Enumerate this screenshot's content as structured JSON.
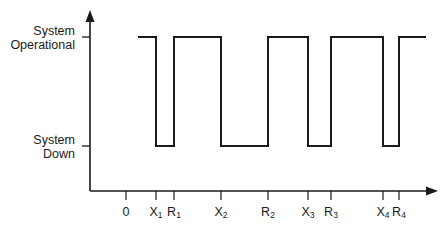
{
  "diagram": {
    "title": "",
    "y_levels": [
      {
        "id": "up",
        "label_lines": [
          "System",
          "Operational"
        ]
      },
      {
        "id": "down",
        "label_lines": [
          "System",
          "Down"
        ]
      }
    ],
    "x_ticks": [
      {
        "main": "0",
        "sub": ""
      },
      {
        "main": "X",
        "sub": "1"
      },
      {
        "main": "R",
        "sub": "1"
      },
      {
        "main": "X",
        "sub": "2"
      },
      {
        "main": "R",
        "sub": "2"
      },
      {
        "main": "X",
        "sub": "3"
      },
      {
        "main": "R",
        "sub": "3"
      },
      {
        "main": "X",
        "sub": "4"
      },
      {
        "main": "R",
        "sub": "4"
      }
    ],
    "waveform": [
      {
        "state": "up",
        "from": "start",
        "to": "X1"
      },
      {
        "state": "down",
        "from": "X1",
        "to": "R1"
      },
      {
        "state": "up",
        "from": "R1",
        "to": "X2"
      },
      {
        "state": "down",
        "from": "X2",
        "to": "R2"
      },
      {
        "state": "up",
        "from": "R2",
        "to": "X3"
      },
      {
        "state": "down",
        "from": "X3",
        "to": "R3"
      },
      {
        "state": "up",
        "from": "R3",
        "to": "X4"
      },
      {
        "state": "down",
        "from": "X4",
        "to": "R4"
      },
      {
        "state": "up",
        "from": "R4",
        "to": "end"
      }
    ],
    "line_color": "#1a1a1a"
  }
}
